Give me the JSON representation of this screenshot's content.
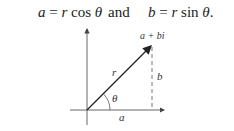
{
  "equation": {
    "left": "a = r cos θ",
    "conjunction": "and",
    "right": "b = r sin θ."
  },
  "diagram": {
    "point_label": "a + bi",
    "radius_label": "r",
    "angle_label": "θ",
    "horizontal_label": "a",
    "vertical_label": "b",
    "colors": {
      "axis": "#555555",
      "vector": "#222222",
      "dashed": "#666666"
    }
  }
}
